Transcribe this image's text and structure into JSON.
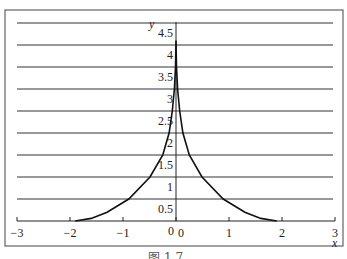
{
  "chart_data": {
    "type": "line",
    "title": "",
    "xlabel": "x",
    "ylabel": "y",
    "xlim": [
      -3,
      3
    ],
    "ylim": [
      0,
      4.5
    ],
    "grid": {
      "horizontal": true,
      "vertical": false
    },
    "legend": null,
    "x_ticks": [
      "-3",
      "-2",
      "-1",
      "0",
      "1",
      "2",
      "3"
    ],
    "y_ticks": [
      "0.5",
      "1",
      "1.5",
      "2",
      "2.5",
      "3",
      "3.5",
      "4",
      "4.5"
    ],
    "origin_labels": [
      "0",
      "0"
    ],
    "series": [
      {
        "name": "curve",
        "x": [
          -1.9,
          -1.6,
          -1.3,
          -0.89,
          -0.49,
          -0.25,
          -0.13,
          -0.07,
          -0.03,
          -0.01,
          0,
          0.01,
          0.03,
          0.07,
          0.13,
          0.25,
          0.49,
          0.89,
          1.3,
          1.6,
          1.9
        ],
        "y": [
          0.0,
          0.06,
          0.2,
          0.5,
          1.0,
          1.5,
          2.0,
          2.5,
          3.0,
          3.5,
          4.1,
          3.5,
          3.0,
          2.5,
          2.0,
          1.5,
          1.0,
          0.5,
          0.2,
          0.06,
          0.0
        ]
      }
    ],
    "colors": {
      "line": "#111111",
      "grid": "#333333",
      "frame": "#444444"
    }
  },
  "caption": "图 1.7  …"
}
